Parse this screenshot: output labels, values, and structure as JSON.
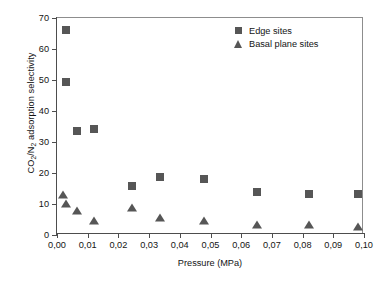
{
  "chart_data": {
    "type": "scatter",
    "title": "",
    "xlabel": "Pressure (MPa)",
    "ylabel": "CO2/N2 adsorption selectivity",
    "ylabel_parts": {
      "pre": "CO",
      "sub1": "2",
      "mid": "/N",
      "sub2": "2",
      "post": " adsorption selectivity"
    },
    "xlim": [
      0.0,
      0.1
    ],
    "ylim": [
      0,
      70
    ],
    "grid": false,
    "legend_position": "top-right",
    "xticks": [
      0.0,
      0.01,
      0.02,
      0.03,
      0.04,
      0.05,
      0.06,
      0.07,
      0.08,
      0.09,
      0.1
    ],
    "xticklabels": [
      "0,00",
      "0,01",
      "0,02",
      "0,03",
      "0,04",
      "0,05",
      "0,06",
      "0,07",
      "0,08",
      "0,09",
      "0,10"
    ],
    "yticks": [
      0,
      10,
      20,
      30,
      40,
      50,
      60,
      70
    ],
    "yticklabels": [
      "0",
      "10",
      "20",
      "30",
      "40",
      "50",
      "60",
      "70"
    ],
    "marker_color": "#565656",
    "axis_color": "#4d4d4d",
    "series": [
      {
        "name": "Edge sites",
        "marker": "square",
        "color": "#565656",
        "points": [
          {
            "x": 0.003,
            "y": 66.0
          },
          {
            "x": 0.003,
            "y": 49.5
          },
          {
            "x": 0.0065,
            "y": 33.5
          },
          {
            "x": 0.0122,
            "y": 34.3
          },
          {
            "x": 0.0245,
            "y": 15.7
          },
          {
            "x": 0.0335,
            "y": 18.7
          },
          {
            "x": 0.048,
            "y": 18.0
          },
          {
            "x": 0.065,
            "y": 14.0
          },
          {
            "x": 0.082,
            "y": 13.2
          },
          {
            "x": 0.098,
            "y": 13.1
          }
        ]
      },
      {
        "name": "Basal plane sites",
        "marker": "triangle",
        "color": "#565656",
        "points": [
          {
            "x": 0.002,
            "y": 12.8
          },
          {
            "x": 0.003,
            "y": 9.9
          },
          {
            "x": 0.0065,
            "y": 7.7
          },
          {
            "x": 0.0122,
            "y": 4.6
          },
          {
            "x": 0.0245,
            "y": 8.6
          },
          {
            "x": 0.0335,
            "y": 5.5
          },
          {
            "x": 0.048,
            "y": 4.4
          },
          {
            "x": 0.065,
            "y": 3.3
          },
          {
            "x": 0.082,
            "y": 3.2
          },
          {
            "x": 0.098,
            "y": 2.5
          }
        ]
      }
    ]
  }
}
